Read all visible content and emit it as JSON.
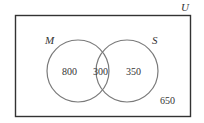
{
  "diagram": {
    "type": "venn",
    "universe_label": "U",
    "sets": [
      {
        "label": "M",
        "only_value": "800"
      },
      {
        "label": "S",
        "only_value": "350"
      }
    ],
    "intersection_value": "300",
    "outside_value": "650",
    "colors": {
      "stroke_rect": "#333333",
      "stroke_circle": "#7a7a7a",
      "text": "#333333"
    }
  }
}
